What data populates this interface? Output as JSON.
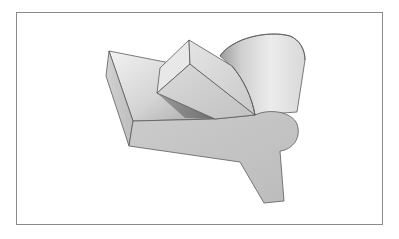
{
  "figure": {
    "type": "isometric-solid-drawing",
    "description": "Shaded 3D solid: rectangular plate with angled prism beam, truncated cylinder, rounded disk end and downward tab",
    "frame": {
      "x": 16,
      "y": 12,
      "width": 367,
      "height": 213,
      "color": "#8a8a8a"
    },
    "colors": {
      "background": "#ffffff",
      "edge": "#5a5a5a",
      "face_light": "#e6e6e6",
      "face_mid": "#c8c8c8",
      "face_dark": "#a9a9a9",
      "shadow": "#8e8e8e"
    },
    "parts": [
      {
        "id": "plate",
        "label": "rectangular plate"
      },
      {
        "id": "beam",
        "label": "prism beam"
      },
      {
        "id": "cylinder",
        "label": "truncated cylinder"
      },
      {
        "id": "disk",
        "label": "rounded disk end"
      },
      {
        "id": "tab",
        "label": "downward tab"
      }
    ]
  }
}
